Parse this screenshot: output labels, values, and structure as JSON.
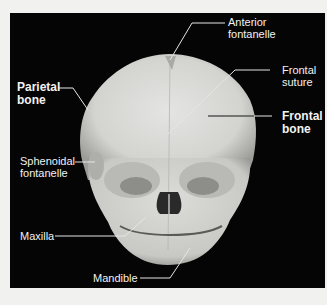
{
  "figure": {
    "background_color": "#050505",
    "page_color": "#f1f1f0",
    "bone_color": "#d9dad6",
    "line_color": "#e6e6e6",
    "labels": [
      {
        "id": "anterior-fontanelle",
        "text": "Anterior\nfontanelle",
        "bold": false
      },
      {
        "id": "frontal-suture",
        "text": "Frontal\nsuture",
        "bold": false
      },
      {
        "id": "parietal-bone",
        "text": "Parietal\nbone",
        "bold": true
      },
      {
        "id": "frontal-bone",
        "text": "Frontal\nbone",
        "bold": true
      },
      {
        "id": "sphenoidal-fontanelle",
        "text": "Sphenoidal\nfontanelle",
        "bold": false
      },
      {
        "id": "maxilla",
        "text": "Maxilla",
        "bold": false
      },
      {
        "id": "mandible",
        "text": "Mandible",
        "bold": false
      }
    ]
  }
}
